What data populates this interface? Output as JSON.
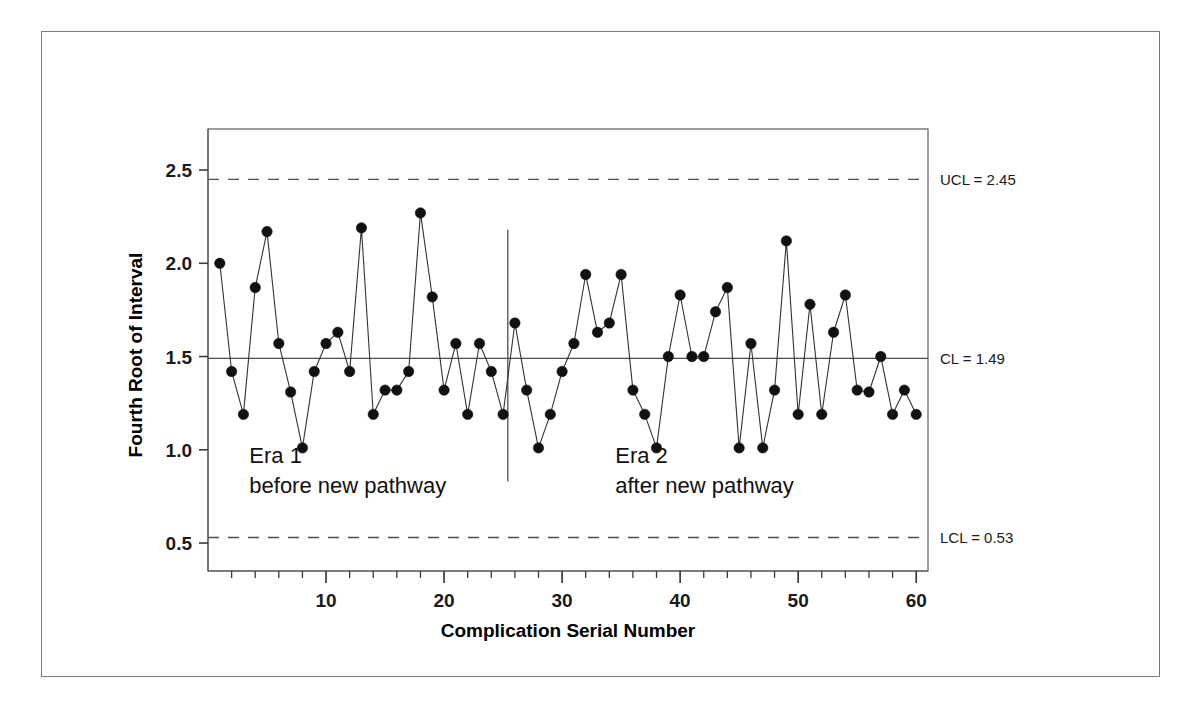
{
  "figure": {
    "background_color": "#ffffff",
    "frame_color": "#7b7b7b"
  },
  "chart_data": {
    "type": "line",
    "title": "",
    "subtitle": "",
    "xlabel": "Complication Serial Number",
    "ylabel": "Fourth Root of Interval",
    "xlim": [
      0,
      61
    ],
    "ylim": [
      0.35,
      2.72
    ],
    "xticks": [
      10,
      20,
      30,
      40,
      50,
      60
    ],
    "xtick_labels": [
      "10",
      "20",
      "30",
      "40",
      "50",
      "60"
    ],
    "yticks": [
      0.5,
      1.0,
      1.5,
      2.0,
      2.5
    ],
    "ytick_labels": [
      "0.5",
      "1.0",
      "1.5",
      "2.0",
      "2.5"
    ],
    "minor_xtick_interval": 2,
    "grid": false,
    "legend": "none",
    "marker": "filled-circle",
    "marker_color": "#111111",
    "line_color": "#333333",
    "x": [
      1,
      2,
      3,
      4,
      5,
      6,
      7,
      8,
      9,
      10,
      11,
      12,
      13,
      14,
      15,
      16,
      17,
      18,
      19,
      20,
      21,
      22,
      23,
      24,
      25,
      26,
      27,
      28,
      29,
      30,
      31,
      32,
      33,
      34,
      35,
      36,
      37,
      38,
      39,
      40,
      41,
      42,
      43,
      44,
      45,
      46,
      47,
      48,
      49,
      50,
      51,
      52,
      53,
      54,
      55,
      56,
      57,
      58,
      59,
      60
    ],
    "values": [
      2.0,
      1.42,
      1.19,
      1.87,
      2.17,
      1.57,
      1.31,
      1.01,
      1.42,
      1.57,
      1.63,
      1.42,
      2.19,
      1.19,
      1.32,
      1.32,
      1.42,
      2.27,
      1.82,
      1.32,
      1.57,
      1.19,
      1.57,
      1.42,
      1.19,
      1.68,
      1.32,
      1.01,
      1.19,
      1.42,
      1.57,
      1.94,
      1.63,
      1.68,
      1.94,
      1.32,
      1.19,
      1.01,
      1.5,
      1.83,
      1.5,
      1.5,
      1.74,
      1.87,
      1.01,
      1.57,
      1.01,
      1.32,
      2.12,
      1.19,
      1.78,
      1.19,
      1.63,
      1.83,
      1.32,
      1.31,
      1.5,
      1.19,
      1.32,
      1.19
    ],
    "control_lines": [
      {
        "name": "UCL",
        "label": "UCL = 2.45",
        "value": 2.45,
        "style": "dashed"
      },
      {
        "name": "CL",
        "label": "CL = 1.49",
        "value": 1.49,
        "style": "solid"
      },
      {
        "name": "LCL",
        "label": "LCL = 0.53",
        "value": 0.53,
        "style": "dashed"
      }
    ],
    "phase_divider": {
      "after_x": 25.4,
      "style": "solid"
    },
    "annotations": [
      {
        "name": "era-1",
        "line1": "Era 1",
        "line2": "before new pathway",
        "x": 3.5,
        "y": 0.93
      },
      {
        "name": "era-2",
        "line1": "Era 2",
        "line2": "after new pathway",
        "x": 34.5,
        "y": 0.93
      }
    ]
  }
}
